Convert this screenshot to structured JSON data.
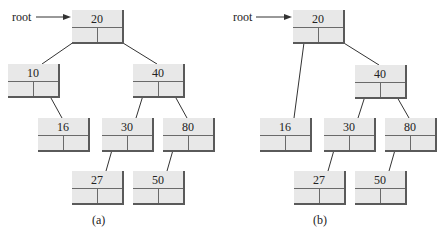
{
  "diagrams": [
    {
      "id": "a",
      "caption": "(a)",
      "root_label": "root",
      "nodes": [
        {
          "key": "n20",
          "value": "20",
          "x": 72,
          "y": 10
        },
        {
          "key": "n10",
          "value": "10",
          "x": 8,
          "y": 64
        },
        {
          "key": "n40",
          "value": "40",
          "x": 133,
          "y": 64
        },
        {
          "key": "n16",
          "value": "16",
          "x": 38,
          "y": 118
        },
        {
          "key": "n30",
          "value": "30",
          "x": 102,
          "y": 118
        },
        {
          "key": "n80",
          "value": "80",
          "x": 163,
          "y": 118
        },
        {
          "key": "n27",
          "value": "27",
          "x": 72,
          "y": 171
        },
        {
          "key": "n50",
          "value": "50",
          "x": 133,
          "y": 171
        }
      ],
      "edges": [
        {
          "from": "n20",
          "side": "left",
          "to": "n10"
        },
        {
          "from": "n20",
          "side": "right",
          "to": "n40"
        },
        {
          "from": "n10",
          "side": "right",
          "to": "n16"
        },
        {
          "from": "n40",
          "side": "left",
          "to": "n30"
        },
        {
          "from": "n40",
          "side": "right",
          "to": "n80"
        },
        {
          "from": "n30",
          "side": "left",
          "to": "n27"
        },
        {
          "from": "n80",
          "side": "left",
          "to": "n50"
        }
      ],
      "root_label_pos": {
        "x": 12,
        "y": 10
      },
      "arrow": {
        "x1": 36,
        "y1": 17,
        "x2": 71,
        "y2": 17
      },
      "caption_pos": {
        "x": 92,
        "y": 213
      }
    },
    {
      "id": "b",
      "caption": "(b)",
      "root_label": "root",
      "nodes": [
        {
          "key": "n20",
          "value": "20",
          "x": 293,
          "y": 10
        },
        {
          "key": "n40",
          "value": "40",
          "x": 355,
          "y": 65
        },
        {
          "key": "n16",
          "value": "16",
          "x": 260,
          "y": 118
        },
        {
          "key": "n30",
          "value": "30",
          "x": 324,
          "y": 118
        },
        {
          "key": "n80",
          "value": "80",
          "x": 385,
          "y": 118
        },
        {
          "key": "n27",
          "value": "27",
          "x": 294,
          "y": 171
        },
        {
          "key": "n50",
          "value": "50",
          "x": 355,
          "y": 171
        }
      ],
      "edges": [
        {
          "from": "n20",
          "side": "left",
          "to": "n16"
        },
        {
          "from": "n20",
          "side": "right",
          "to": "n40"
        },
        {
          "from": "n40",
          "side": "left",
          "to": "n30"
        },
        {
          "from": "n40",
          "side": "right",
          "to": "n80"
        },
        {
          "from": "n30",
          "side": "left",
          "to": "n27"
        },
        {
          "from": "n80",
          "side": "left",
          "to": "n50"
        }
      ],
      "root_label_pos": {
        "x": 233,
        "y": 10
      },
      "arrow": {
        "x1": 256,
        "y1": 17,
        "x2": 292,
        "y2": 17
      },
      "caption_pos": {
        "x": 313,
        "y": 213
      }
    }
  ],
  "colors": {
    "node_fill": "#e8e8e8",
    "node_shadow": "#5a5a5a",
    "line": "#333333",
    "text": "#222222"
  }
}
